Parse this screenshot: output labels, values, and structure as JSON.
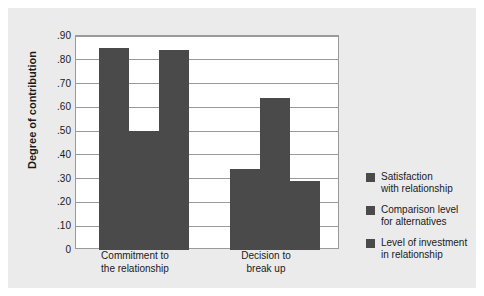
{
  "chart_data": {
    "type": "bar",
    "title": "",
    "xlabel": "",
    "ylabel": "Degree of contribution",
    "ylim": [
      0,
      0.9
    ],
    "grid": true,
    "legend_position": "right",
    "categories": [
      "Commitment to\nthe relationship",
      "Decision to\nbreak up"
    ],
    "ytick_labels": [
      ".90",
      ".80",
      ".70",
      ".60",
      ".50",
      ".40",
      ".30",
      ".20",
      ".10",
      "0"
    ],
    "ytick_values": [
      0.9,
      0.8,
      0.7,
      0.6,
      0.5,
      0.4,
      0.3,
      0.2,
      0.1,
      0
    ],
    "series": [
      {
        "name": "Satisfaction\nwith relationship",
        "color": "#4a4a4a",
        "values": [
          0.85,
          0.34
        ]
      },
      {
        "name": "Comparison level\nfor alternatives",
        "color": "#4a4a4a",
        "values": [
          0.5,
          0.64
        ]
      },
      {
        "name": "Level of investment\nin relationship",
        "color": "#4a4a4a",
        "values": [
          0.84,
          0.29
        ]
      }
    ]
  },
  "colors": {
    "panel": "#ebebeb",
    "plot_background": "#ffffff",
    "axis": "#9a9a9a",
    "bar": "#4a4a4a",
    "text": "#1a1a1a"
  }
}
